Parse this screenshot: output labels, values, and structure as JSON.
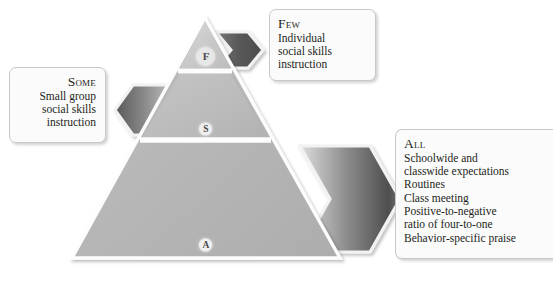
{
  "figure": {
    "type": "three-tier-pyramid-diagram"
  },
  "colors": {
    "tier_top": "#cfcfcf",
    "tier_middle": "#bdbdbd",
    "tier_bottom": "#b6b6b6",
    "arrow_dark": "#5f5f5f",
    "arrow_light": "#d8d8d8",
    "box_fill": "#fbfbfb",
    "box_border": "#c9c9c9",
    "text": "#231f20",
    "divider": "#ffffff"
  },
  "pyramid": {
    "tiers": [
      {
        "id": "few",
        "badge": "F",
        "level": "top"
      },
      {
        "id": "some",
        "badge": "S",
        "level": "middle"
      },
      {
        "id": "all",
        "badge": "A",
        "level": "bottom"
      }
    ]
  },
  "callouts": {
    "few": {
      "heading": "Few",
      "lines": [
        "Individual",
        "social skills",
        "instruction"
      ]
    },
    "some": {
      "heading": "Some",
      "lines": [
        "Small group",
        "social skills",
        "instruction"
      ]
    },
    "all": {
      "heading": "All",
      "lines": [
        "Schoolwide and",
        "classwide expectations",
        "Routines",
        "Class meeting",
        "Positive-to-negative",
        "ratio of four-to-one",
        "Behavior-specific praise"
      ]
    }
  },
  "arrows": [
    {
      "id": "arrow-few",
      "direction": "right",
      "points_to": "few-callout"
    },
    {
      "id": "arrow-some",
      "direction": "left",
      "points_to": "some-callout"
    },
    {
      "id": "arrow-all",
      "direction": "right",
      "points_to": "all-callout"
    }
  ]
}
